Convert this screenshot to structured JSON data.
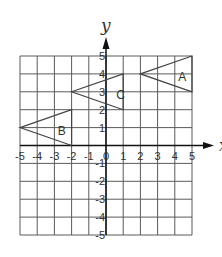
{
  "diagram": {
    "type": "coordinate-plane",
    "x_range": [
      -5,
      5
    ],
    "y_range": [
      -5,
      5
    ],
    "x_axis_label": "x",
    "y_axis_label": "y",
    "x_ticks": [
      "-5",
      "-4",
      "-3",
      "-2",
      "-1",
      "0",
      "1",
      "2",
      "3",
      "4",
      "5"
    ],
    "y_ticks": [
      "5",
      "4",
      "3",
      "2",
      "1",
      "-1",
      "-2",
      "-3",
      "-4",
      "-5"
    ],
    "grid": true,
    "colors": {
      "grid": "#5a5a5a",
      "axis": "#111111",
      "shape": "#444444",
      "text": "#333333"
    },
    "shapes": [
      {
        "label": "A",
        "vertices": [
          [
            2,
            4
          ],
          [
            5,
            5
          ],
          [
            5,
            3
          ]
        ],
        "label_pos": [
          4.2,
          3.8
        ]
      },
      {
        "label": "B",
        "vertices": [
          [
            -5,
            1
          ],
          [
            -2,
            2
          ],
          [
            -2,
            0
          ]
        ],
        "label_pos": [
          -2.8,
          0.8
        ]
      },
      {
        "label": "C",
        "vertices": [
          [
            -2,
            3
          ],
          [
            1,
            4
          ],
          [
            1,
            2
          ]
        ],
        "label_pos": [
          0.6,
          2.8
        ]
      }
    ]
  }
}
